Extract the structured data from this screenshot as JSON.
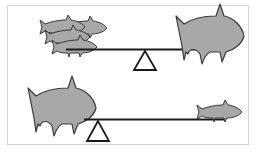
{
  "diagram": {
    "colors": {
      "fish_fill": "#a8a8a8",
      "fish_stroke": "#3a3a3a",
      "beam": "#1a1a1a",
      "fulcrum_stroke": "#1a1a1a",
      "frame": "#d4d4d4"
    },
    "seesaws": [
      {
        "id": "top",
        "left_load": "three small fish",
        "right_load": "one large fish",
        "fulcrum_position": "center",
        "state": "balanced"
      },
      {
        "id": "bottom",
        "left_load": "one large fish",
        "right_load": "one small fish",
        "fulcrum_position": "left",
        "state": "balanced"
      }
    ]
  }
}
